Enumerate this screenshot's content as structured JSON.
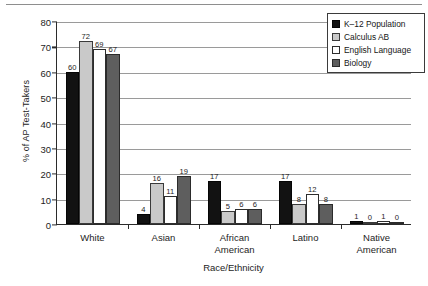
{
  "chart_data": {
    "type": "bar",
    "title": "",
    "xlabel": "Race/Ethnicity",
    "ylabel": "% of AP Test-Takers",
    "ylim": [
      0,
      80
    ],
    "yticks": [
      0,
      10,
      20,
      30,
      40,
      50,
      60,
      70,
      80
    ],
    "grid": "horizontal",
    "legend_position": "top-right",
    "categories": [
      "White",
      "Asian",
      "African American",
      "Latino",
      "Native American"
    ],
    "category_lines": [
      [
        "White"
      ],
      [
        "Asian"
      ],
      [
        "African",
        "American"
      ],
      [
        "Latino"
      ],
      [
        "Native",
        "American"
      ]
    ],
    "series": [
      {
        "name": "K–12 Population",
        "color": "#121212",
        "values": [
          60,
          4,
          17,
          17,
          1
        ]
      },
      {
        "name": "Calculus AB",
        "color": "#c9c9c9",
        "values": [
          72,
          16,
          5,
          8,
          0
        ]
      },
      {
        "name": "English Language",
        "color": "#ffffff",
        "values": [
          69,
          11,
          6,
          12,
          1
        ]
      },
      {
        "name": "Biology",
        "color": "#5e5e5e",
        "values": [
          67,
          19,
          6,
          8,
          0
        ]
      }
    ]
  }
}
